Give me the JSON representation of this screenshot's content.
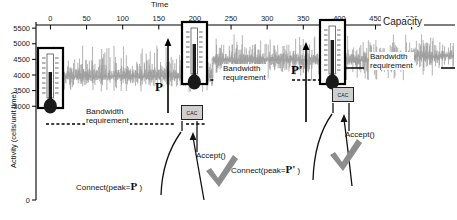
{
  "chart_data": {
    "type": "line",
    "title": "",
    "xlabel": "Time",
    "ylabel": "Activity (cells/unit time)",
    "xticks": [
      0,
      50,
      100,
      150,
      200,
      250,
      300,
      350,
      400,
      450,
      500
    ],
    "yticks": [
      0,
      3000,
      3500,
      4000,
      4500,
      5000,
      5500
    ],
    "xlim": [
      -20,
      560
    ],
    "ylim": [
      0,
      5600
    ],
    "grid": false,
    "legend": null,
    "series": [
      {
        "name": "Aggregate activity (cells/unit time)",
        "style": "noisy-trace",
        "description": "Highly variable grey cell-rate trace rising in three steps as new connections are admitted",
        "segments": [
          {
            "x_start": 0,
            "x_end": 225,
            "baseline": 3950,
            "peak": 4950,
            "trough": 3400
          },
          {
            "x_start": 225,
            "x_end": 495,
            "baseline": 4480,
            "peak": 5300,
            "trough": 3750
          },
          {
            "x_start": 495,
            "x_end": 560,
            "baseline": 4600,
            "peak": 5400,
            "trough": 3900
          }
        ]
      }
    ],
    "reference_lines": [
      {
        "name": "capacity",
        "label": "Capacity",
        "y": 5500,
        "style": "solid",
        "color": "#000000"
      },
      {
        "name": "bandwidth-requirement-1",
        "label": "Bandwidth requirement",
        "y": 3980,
        "x_start": 30,
        "x_end": 225,
        "style": "dashed",
        "color": "#000000"
      },
      {
        "name": "bandwidth-requirement-2",
        "label": "Bandwidth requirement",
        "y": 4480,
        "x_start": 200,
        "x_end": 498,
        "style": "dashed",
        "color": "#000000"
      },
      {
        "name": "bandwidth-requirement-3",
        "label": "Bandwidth requirement",
        "y": 4620,
        "x_start": 340,
        "x_end": 560,
        "style": "solid",
        "color": "#000000"
      }
    ],
    "annotations": [
      {
        "name": "peak-p",
        "label": "P",
        "x": 225,
        "y": 4620,
        "kind": "peak-marker"
      },
      {
        "name": "peak-p-prime",
        "label": "P'",
        "x": 495,
        "y": 4900,
        "kind": "peak-marker"
      },
      {
        "name": "connect-1",
        "label": "Connect(peak=P )",
        "x": 150,
        "y": 3200
      },
      {
        "name": "connect-2",
        "label": "Connect(peak=P' )",
        "x": 300,
        "y": 3250
      },
      {
        "name": "accept-1",
        "label": "Accept()",
        "x": 205,
        "y": 3450
      },
      {
        "name": "accept-2",
        "label": "Accept()",
        "x": 355,
        "y": 3500
      },
      {
        "name": "cac-1",
        "label": "CAC",
        "x": 190,
        "y": 3700
      },
      {
        "name": "cac-2",
        "label": "CAC",
        "x": 340,
        "y": 4150
      }
    ],
    "thermometers": [
      {
        "name": "thermometer-1",
        "x": 20,
        "fill_level": 0.55,
        "description": "measured utilisation gauge at start of trace"
      },
      {
        "name": "thermometer-2",
        "x": 255,
        "fill_level": 0.62,
        "description": "measured utilisation gauge after first admission"
      },
      {
        "name": "thermometer-3",
        "x": 515,
        "fill_level": 0.7,
        "description": "measured utilisation gauge after second admission"
      }
    ],
    "checkmarks": [
      {
        "name": "checkmark-1",
        "x": 215,
        "y": 3150
      },
      {
        "name": "checkmark-2",
        "x": 365,
        "y": 3300
      }
    ]
  },
  "axes": {
    "x_title": "Time",
    "y_title": "Activity (cells/unit time)",
    "x_tick_labels": [
      "0",
      "50",
      "100",
      "150",
      "200",
      "250",
      "300",
      "350",
      "400",
      "450",
      "500"
    ],
    "y_tick_labels": [
      "5500",
      "5000",
      "4500",
      "4000",
      "3500",
      "3000",
      "0"
    ]
  },
  "labels": {
    "capacity": "Capacity",
    "bandwidth_requirement_line1": "Bandwidth",
    "bandwidth_requirement_line2": "requirement",
    "cac": "CAC",
    "accept": "Accept()",
    "connect_prefix": "Connect(peak=",
    "connect_suffix": " )",
    "peak_p": "P",
    "peak_p_prime": "P'"
  },
  "colors": {
    "trace": "#9a9a9a",
    "axis": "#000000",
    "cac_fill": "#cfcfcf",
    "thermometer_fill": "#1a1a1a",
    "background": "#ffffff"
  }
}
